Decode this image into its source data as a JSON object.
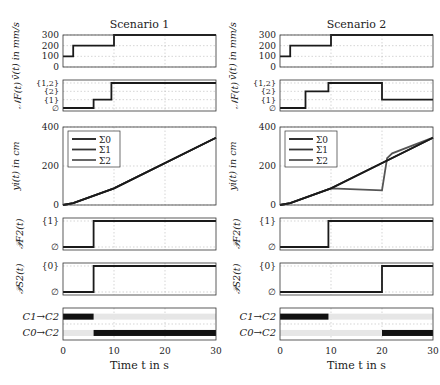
{
  "figure": {
    "columns": [
      {
        "title": "Scenario 1"
      },
      {
        "title": "Scenario 2"
      }
    ],
    "xlabel": "Time t in s",
    "xticks": [
      "0",
      "10",
      "20",
      "30"
    ],
    "xlim": [
      0,
      30
    ],
    "rows": [
      {
        "ylabel": "v̄(t) in mm/s",
        "yticks": [
          "0",
          "100",
          "200",
          "300"
        ]
      },
      {
        "ylabel": "𝒩F(t)",
        "yticks": [
          "∅",
          "{1}",
          "{2}",
          "{1,2}"
        ]
      },
      {
        "ylabel": "yi(t) in cm",
        "yticks": [
          "0",
          "200",
          "400"
        ]
      },
      {
        "ylabel": "𝒫F2(t)",
        "yticks": [
          "∅",
          "{1}"
        ]
      },
      {
        "ylabel": "𝒫S2(t)",
        "yticks": [
          "∅",
          "{0}"
        ]
      },
      {
        "ylabel": "",
        "yticks": [
          "C1→C2",
          "C0→C2"
        ]
      }
    ],
    "legend": [
      "Σ0",
      "Σ1",
      "Σ2"
    ]
  },
  "chart_data": [
    {
      "type": "line",
      "panel": "velocity",
      "scenario": "Scenario 1",
      "title": "Scenario 1",
      "ylabel": "v̄(t) in mm/s",
      "xlabel": "",
      "ylim": [
        0,
        300
      ],
      "x": [
        0,
        2,
        2,
        10,
        10,
        30
      ],
      "values": [
        100,
        100,
        200,
        200,
        300,
        300
      ]
    },
    {
      "type": "line",
      "panel": "velocity",
      "scenario": "Scenario 2",
      "title": "Scenario 2",
      "ylabel": "v̄(t) in mm/s",
      "ylim": [
        0,
        300
      ],
      "x": [
        0,
        2,
        2,
        10,
        10,
        30
      ],
      "values": [
        100,
        100,
        200,
        200,
        300,
        300
      ]
    },
    {
      "type": "line",
      "panel": "NF",
      "scenario": "Scenario 1",
      "ylabel": "𝒩F(t)",
      "categories_y": [
        "∅",
        "{1}",
        "{2}",
        "{1,2}"
      ],
      "x": [
        0,
        6,
        6,
        9.5,
        9.5,
        30
      ],
      "values": [
        "∅",
        "∅",
        "{1}",
        "{1}",
        "{1,2}",
        "{1,2}"
      ]
    },
    {
      "type": "line",
      "panel": "NF",
      "scenario": "Scenario 2",
      "ylabel": "𝒩F(t)",
      "categories_y": [
        "∅",
        "{1}",
        "{2}",
        "{1,2}"
      ],
      "x": [
        0,
        5,
        5,
        9.5,
        9.5,
        20,
        20,
        30
      ],
      "values": [
        "∅",
        "∅",
        "{2}",
        "{2}",
        "{1,2}",
        "{1,2}",
        "{1}",
        "{1}"
      ]
    },
    {
      "type": "line",
      "panel": "position",
      "scenario": "Scenario 1",
      "ylabel": "yi(t) in cm",
      "ylim": [
        0,
        400
      ],
      "series": [
        {
          "name": "Σ0",
          "x": [
            0,
            2,
            10,
            30
          ],
          "values": [
            0,
            10,
            85,
            345
          ]
        },
        {
          "name": "Σ1",
          "x": [
            0,
            2,
            10,
            30
          ],
          "values": [
            0,
            10,
            85,
            345
          ]
        },
        {
          "name": "Σ2",
          "x": [
            0,
            2,
            10,
            30
          ],
          "values": [
            0,
            10,
            85,
            345
          ]
        }
      ]
    },
    {
      "type": "line",
      "panel": "position",
      "scenario": "Scenario 2",
      "ylabel": "yi(t) in cm",
      "ylim": [
        0,
        400
      ],
      "series": [
        {
          "name": "Σ0",
          "x": [
            0,
            2,
            10,
            30
          ],
          "values": [
            0,
            10,
            85,
            345
          ]
        },
        {
          "name": "Σ1",
          "x": [
            0,
            2,
            10,
            30
          ],
          "values": [
            0,
            10,
            85,
            345
          ]
        },
        {
          "name": "Σ2",
          "x": [
            0,
            2,
            10,
            20,
            21,
            22,
            30
          ],
          "values": [
            0,
            10,
            85,
            75,
            240,
            265,
            345
          ]
        }
      ]
    },
    {
      "type": "line",
      "panel": "PF2",
      "scenario": "Scenario 1",
      "ylabel": "𝒫F2(t)",
      "x": [
        0,
        6,
        6,
        30
      ],
      "values": [
        "∅",
        "∅",
        "{1}",
        "{1}"
      ]
    },
    {
      "type": "line",
      "panel": "PF2",
      "scenario": "Scenario 2",
      "ylabel": "𝒫F2(t)",
      "x": [
        0,
        9.5,
        9.5,
        30
      ],
      "values": [
        "∅",
        "∅",
        "{1}",
        "{1}"
      ]
    },
    {
      "type": "line",
      "panel": "PS2",
      "scenario": "Scenario 1",
      "ylabel": "𝒫S2(t)",
      "x": [
        0,
        6,
        6,
        30
      ],
      "values": [
        "∅",
        "∅",
        "{0}",
        "{0}"
      ]
    },
    {
      "type": "line",
      "panel": "PS2",
      "scenario": "Scenario 2",
      "ylabel": "𝒫S2(t)",
      "x": [
        0,
        20,
        20,
        30
      ],
      "values": [
        "∅",
        "∅",
        "{0}",
        "{0}"
      ]
    },
    {
      "type": "heatmap",
      "panel": "transitions",
      "scenario": "Scenario 1",
      "xlabel": "Time t in s",
      "categories": [
        "C1→C2",
        "C0→C2"
      ],
      "series": [
        {
          "name": "C1→C2",
          "active": [
            [
              0,
              6
            ]
          ]
        },
        {
          "name": "C0→C2",
          "active": [
            [
              6,
              30
            ]
          ]
        }
      ]
    },
    {
      "type": "heatmap",
      "panel": "transitions",
      "scenario": "Scenario 2",
      "xlabel": "Time t in s",
      "categories": [
        "C1→C2",
        "C0→C2"
      ],
      "series": [
        {
          "name": "C1→C2",
          "active": [
            [
              0,
              9.5
            ]
          ]
        },
        {
          "name": "C0→C2",
          "active": [
            [
              20,
              30
            ]
          ]
        }
      ]
    }
  ]
}
